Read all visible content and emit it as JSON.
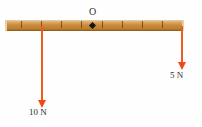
{
  "figure": {
    "width": 202,
    "height": 127,
    "background": "#fefefe"
  },
  "beam": {
    "name": "wooden-ruler",
    "left": 5,
    "top": 20,
    "width": 179,
    "height": 11,
    "wood_color": "#c98c3e",
    "wood_highlight": "#e2ba7e",
    "wood_shadow": "#a96f26",
    "tick_color": "#6d4413",
    "tick_positions": [
      21,
      41,
      61,
      81,
      102,
      122,
      142,
      162
    ],
    "tick_spacing": 20
  },
  "pivot": {
    "label": "O",
    "label_x": 89,
    "label_y": 7,
    "marker_x": 90,
    "marker_y": 23,
    "marker_color": "#141414",
    "marker_shape": "diamond"
  },
  "forces": [
    {
      "name": "left-force-arrow",
      "label": "10 N",
      "magnitude": 10,
      "unit": "N",
      "direction": "down",
      "x": 41,
      "top": 26,
      "length": 74,
      "color": "#ef5a1c",
      "label_x": 29,
      "label_y": 108
    },
    {
      "name": "right-force-arrow",
      "label": "5 N",
      "magnitude": 5,
      "unit": "N",
      "direction": "down",
      "x": 181,
      "top": 26,
      "length": 36,
      "color": "#ef5a1c",
      "label_x": 170,
      "label_y": 71
    }
  ]
}
